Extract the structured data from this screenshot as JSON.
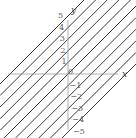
{
  "figure": {
    "background_color": "#ffffff",
    "line_color": "#3a3a3a",
    "axis_color": "#9a9a9a",
    "label_color": "#5a5a5a"
  },
  "axes": {
    "x_label": "x",
    "y_label": "y"
  },
  "chart_data": {
    "type": "line",
    "title": "",
    "xlabel": "x",
    "ylabel": "y",
    "grid": false,
    "legend": null,
    "xlim": [
      -6,
      6
    ],
    "ylim": [
      -6,
      6
    ],
    "slope": 1,
    "series": [
      {
        "name": "y = x + 5",
        "intercept": 5,
        "slope": 1
      },
      {
        "name": "y = x + 4",
        "intercept": 4,
        "slope": 1
      },
      {
        "name": "y = x + 3",
        "intercept": 3,
        "slope": 1
      },
      {
        "name": "y = x + 2",
        "intercept": 2,
        "slope": 1
      },
      {
        "name": "y = x + 1",
        "intercept": 1,
        "slope": 1
      },
      {
        "name": "y = x",
        "intercept": 0,
        "slope": 1
      },
      {
        "name": "y = x - 1",
        "intercept": -1,
        "slope": 1
      },
      {
        "name": "y = x - 2",
        "intercept": -2,
        "slope": 1
      },
      {
        "name": "y = x - 3",
        "intercept": -3,
        "slope": 1
      },
      {
        "name": "y = x - 4",
        "intercept": -4,
        "slope": 1
      },
      {
        "name": "y = x - 5",
        "intercept": -5,
        "slope": 1
      }
    ],
    "intercept_labels": [
      {
        "text": "5",
        "value": 5
      },
      {
        "text": "4",
        "value": 4
      },
      {
        "text": "3",
        "value": 3
      },
      {
        "text": "2",
        "value": 2
      },
      {
        "text": "1",
        "value": 1
      },
      {
        "text": "0",
        "value": 0
      },
      {
        "text": "−1",
        "value": -1
      },
      {
        "text": "−2",
        "value": -2
      },
      {
        "text": "−3",
        "value": -3
      },
      {
        "text": "−4",
        "value": -4
      },
      {
        "text": "−5",
        "value": -5
      }
    ]
  }
}
